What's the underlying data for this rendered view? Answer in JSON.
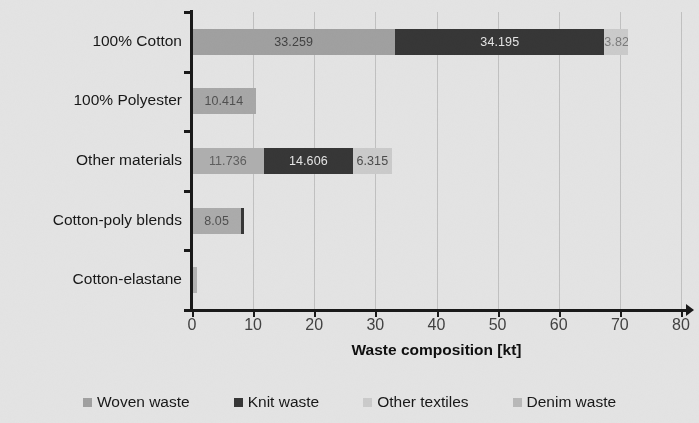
{
  "chart_data": {
    "type": "bar",
    "orientation": "horizontal",
    "stacked": true,
    "title": "",
    "xlabel": "Waste composition [kt]",
    "ylabel": "",
    "xlim": [
      0,
      80
    ],
    "xticks": [
      0,
      10,
      20,
      30,
      40,
      50,
      60,
      70,
      80
    ],
    "xtick_labels": [
      "0",
      "10",
      "20",
      "30",
      "40",
      "50",
      "60",
      "70",
      "80"
    ],
    "grid": "vertical",
    "legend_position": "bottom",
    "categories": [
      "100% Cotton",
      "100% Polyester",
      "Other materials",
      "Cotton-poly blends",
      "Cotton-elastane"
    ],
    "series": [
      {
        "name": "Woven waste",
        "color": "#b4b4b4",
        "values": [
          33.259,
          10.414,
          11.736,
          8.05,
          0.8
        ],
        "labels": [
          "33.259",
          "10.414",
          "11.736",
          "8.05",
          ""
        ]
      },
      {
        "name": "Knit waste",
        "color": "#3d3d3d",
        "values": [
          34.195,
          0,
          14.606,
          0.45,
          0
        ],
        "labels": [
          "34.195",
          "",
          "14.606",
          "",
          ""
        ]
      },
      {
        "name": "Other textiles",
        "color": "#e3e3e3",
        "values": [
          3.824,
          0,
          6.315,
          0,
          0
        ],
        "labels": [
          "3.824",
          "",
          "6.315",
          "",
          ""
        ]
      },
      {
        "name": "Denim waste",
        "color": "#cfcfcf",
        "values": [
          0,
          0,
          0,
          0,
          0
        ],
        "labels": [
          "",
          "",
          "",
          "",
          ""
        ]
      }
    ]
  },
  "axis": {
    "x_title": "Waste composition [kt]",
    "ticks": [
      {
        "value": "0"
      },
      {
        "value": "10"
      },
      {
        "value": "20"
      },
      {
        "value": "30"
      },
      {
        "value": "40"
      },
      {
        "value": "50"
      },
      {
        "value": "60"
      },
      {
        "value": "70"
      },
      {
        "value": "80"
      }
    ]
  },
  "categories": [
    {
      "label": "100% Cotton"
    },
    {
      "label": "100% Polyester"
    },
    {
      "label": "Other materials"
    },
    {
      "label": "Cotton-poly blends"
    },
    {
      "label": "Cotton-elastane"
    }
  ],
  "bars": [
    {
      "category": "100% Cotton",
      "segments": [
        {
          "series": "Woven waste",
          "value": 33.259,
          "label": "33.259",
          "color": "#b4b4b4",
          "label_color": "#4a4a4a",
          "label_inside": true
        },
        {
          "series": "Knit waste",
          "value": 34.195,
          "label": "34.195",
          "color": "#3d3d3d",
          "label_color": "#ffffff",
          "label_inside": true
        },
        {
          "series": "Other textiles",
          "value": 3.824,
          "label": "3.824",
          "color": "#e3e3e3",
          "label_color": "#8a8a8a",
          "label_inside": true
        }
      ]
    },
    {
      "category": "100% Polyester",
      "segments": [
        {
          "series": "Woven waste",
          "value": 10.414,
          "label": "10.414",
          "color": "#bcbcbc",
          "label_color": "#5a5a5a",
          "label_inside": true
        }
      ]
    },
    {
      "category": "Other materials",
      "segments": [
        {
          "series": "Woven waste",
          "value": 11.736,
          "label": "11.736",
          "color": "#c4c4c4",
          "label_color": "#6a6a6a",
          "label_inside": true
        },
        {
          "series": "Knit waste",
          "value": 14.606,
          "label": "14.606",
          "color": "#3d3d3d",
          "label_color": "#ffffff",
          "label_inside": true
        },
        {
          "series": "Other textiles",
          "value": 6.315,
          "label": "6.315",
          "color": "#e3e3e3",
          "label_color": "#555555",
          "label_inside": true
        }
      ]
    },
    {
      "category": "Cotton-poly blends",
      "segments": [
        {
          "series": "Woven waste",
          "value": 8.05,
          "label": "8.05",
          "color": "#c0c0c0",
          "label_color": "#5a5a5a",
          "label_inside": true
        },
        {
          "series": "Knit waste",
          "value": 0.45,
          "label": "",
          "color": "#3d3d3d",
          "label_color": "#ffffff",
          "label_inside": true
        }
      ]
    },
    {
      "category": "Cotton-elastane",
      "segments": [
        {
          "series": "Woven waste",
          "value": 0.8,
          "label": "",
          "color": "#c8c8c8",
          "label_color": "#5a5a5a",
          "label_inside": true
        }
      ]
    }
  ],
  "legend": [
    {
      "label": "Woven waste",
      "color": "#b4b4b4"
    },
    {
      "label": "Knit waste",
      "color": "#3d3d3d"
    },
    {
      "label": "Other textiles",
      "color": "#e3e3e3"
    },
    {
      "label": "Denim waste",
      "color": "#cfcfcf"
    }
  ]
}
